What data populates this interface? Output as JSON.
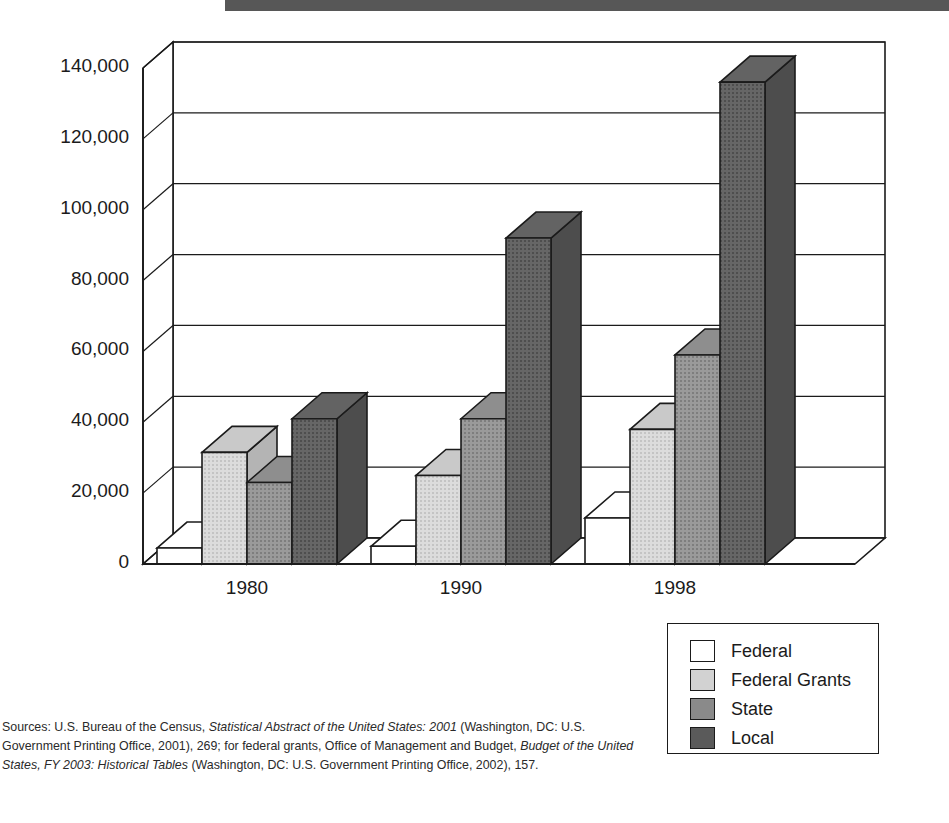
{
  "title_band": {
    "color": "#575757"
  },
  "chart_data": {
    "type": "bar",
    "title": "",
    "subtitle": "",
    "xlabel": "",
    "ylabel": "",
    "categories": [
      "1980",
      "1990",
      "1998"
    ],
    "series": [
      {
        "name": "Federal",
        "color": "#ffffff",
        "values": [
          4500,
          5000,
          13000
        ]
      },
      {
        "name": "Federal Grants",
        "color": "#d2d2d2",
        "values": [
          31500,
          25000,
          38000
        ]
      },
      {
        "name": "State",
        "color": "#8a8a8a",
        "values": [
          23000,
          41000,
          59000
        ]
      },
      {
        "name": "Local",
        "color": "#5a5a5a",
        "values": [
          41000,
          92000,
          136000
        ]
      }
    ],
    "ylim": [
      0,
      140000
    ],
    "yticks": [
      0,
      20000,
      40000,
      60000,
      80000,
      100000,
      120000,
      140000
    ],
    "ytick_labels": [
      "0",
      "20,000",
      "40,000",
      "60,000",
      "80,000",
      "100,000",
      "120,000",
      "140,000"
    ],
    "grid": true,
    "legend_position": "bottom-right",
    "three_d": true
  },
  "legend": {
    "items": [
      {
        "label": "Federal",
        "color": "#ffffff"
      },
      {
        "label": "Federal Grants",
        "color": "#d2d2d2"
      },
      {
        "label": "State",
        "color": "#8a8a8a"
      },
      {
        "label": "Local",
        "color": "#5a5a5a"
      }
    ]
  },
  "source_note": {
    "line1_a": "Sources: U.S. Bureau of the Census, ",
    "line1_italic": "Statistical Abstract of the United States: 2001",
    "line1_b": " (Washington, DC: U.S.",
    "line2_a": "Government Printing Office, 2001), 269; for federal grants, Office of Management and Budget, ",
    "line2_italic": "Budget of",
    "line3_italic": "the United States, FY 2003: Historical Tables",
    "line3_b": " (Washington, DC: U.S. Government Printing Office, 2002), 157."
  }
}
